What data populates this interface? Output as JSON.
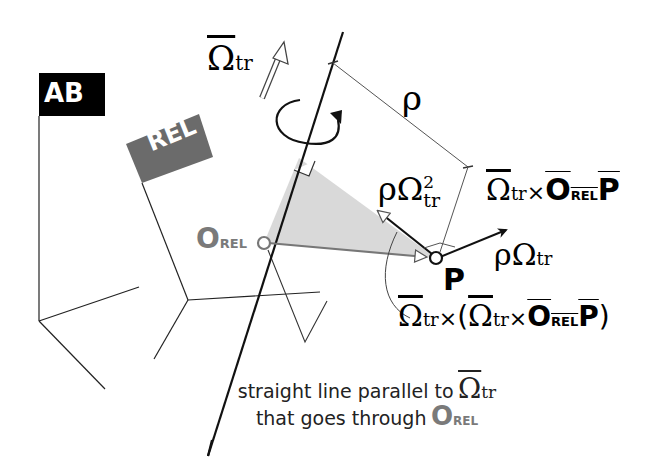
{
  "figure": {
    "frames": {
      "absolute_label": "AB",
      "relative_label": "REL"
    },
    "symbols": {
      "omega": "Ω",
      "rho": "ρ",
      "times": "×",
      "sub_tr": "tr",
      "sub_rel": "REL",
      "sup_2": "2",
      "origin": "O",
      "point": "P",
      "open_paren": "(",
      "close_paren": ")"
    },
    "labels": {
      "omega_tr": "Ω",
      "rho_distance": "ρ",
      "centripetal": "ρΩ",
      "tangential": "ρΩ",
      "point_p": "P",
      "origin_rel": "O",
      "caption_line1": "straight line parallel to",
      "caption_line2": "that goes through"
    },
    "colors": {
      "ab_flag": "#000000",
      "rel_flag": "#6b6b6b",
      "origin_gray": "#7a7a7a",
      "fill_gray": "#d9d9d9",
      "line": "#111111"
    }
  }
}
